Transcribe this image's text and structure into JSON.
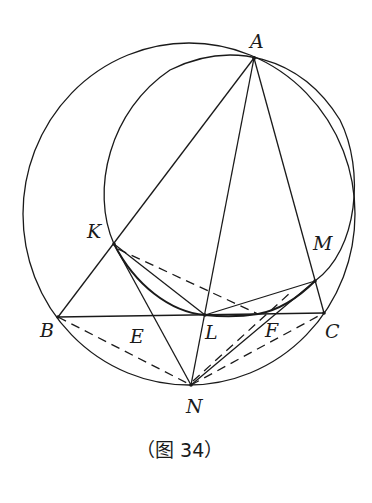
{
  "figure": {
    "caption": "（图 34）",
    "caption_parts": {
      "open": "（",
      "text": "图 34",
      "close": "）"
    }
  },
  "points": {
    "A": {
      "label": "A",
      "x": 254,
      "y": 58
    },
    "B": {
      "label": "B",
      "x": 58,
      "y": 317
    },
    "C": {
      "label": "C",
      "x": 324,
      "y": 313
    },
    "K": {
      "label": "K",
      "x": 114,
      "y": 244
    },
    "M": {
      "label": "M",
      "x": 315,
      "y": 281
    },
    "L": {
      "label": "L",
      "x": 205,
      "y": 315
    },
    "E": {
      "label": "E",
      "x": 153,
      "y": 316
    },
    "F": {
      "label": "F",
      "x": 270,
      "y": 314
    },
    "N": {
      "label": "N",
      "x": 191,
      "y": 385
    }
  },
  "circles": [
    {
      "name": "circumcircle-ABC",
      "cx": 189,
      "cy": 214,
      "r": 167
    },
    {
      "name": "circle-AKM",
      "cx": 228,
      "cy": 182,
      "r": 127
    }
  ],
  "segments": {
    "solid": [
      "AB",
      "AL",
      "AC",
      "BC",
      "KN",
      "KL",
      "LM",
      "LN",
      "NM"
    ],
    "dashed": [
      "BN",
      "NC",
      "KX",
      "NX"
    ],
    "arcs": [
      "K-L-M small arc"
    ]
  },
  "colors": {
    "stroke": "#1a1a1a",
    "background": "#ffffff"
  }
}
